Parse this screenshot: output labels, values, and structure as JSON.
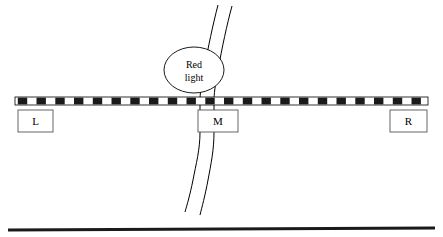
{
  "diagram": {
    "colors": {
      "stroke": "#000000",
      "stripe_dark": "#1a1a1a",
      "stripe_light": "#ffffff",
      "background": "#ffffff"
    },
    "barrier": {
      "name": "striped-barrier",
      "x": 15,
      "y": 97,
      "width": 413,
      "height": 8,
      "stripe_count": 22
    },
    "boxes": [
      {
        "id": "left",
        "label": "L",
        "x": 18,
        "y": 110,
        "width": 35,
        "height": 22
      },
      {
        "id": "middle",
        "label": "M",
        "x": 198,
        "y": 110,
        "width": 40,
        "height": 22
      },
      {
        "id": "right",
        "label": "R",
        "x": 390,
        "y": 110,
        "width": 37,
        "height": 22
      }
    ],
    "callout": {
      "name": "red-light-ellipse",
      "cx": 194,
      "cy": 70,
      "rx": 30,
      "ry": 23,
      "line1": "Red",
      "line2": "light"
    },
    "road": {
      "name": "road-path",
      "description": "two-lane road running vertically through the middle box"
    },
    "ground_line": {
      "name": "ground-line",
      "x1": 8,
      "y1": 230,
      "x2": 435,
      "y2": 228,
      "thickness": 3
    }
  }
}
